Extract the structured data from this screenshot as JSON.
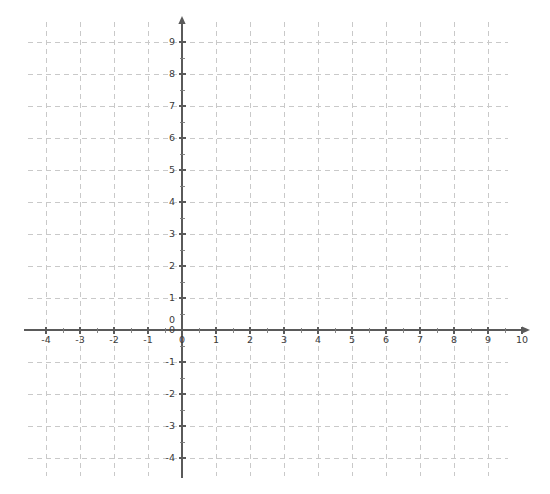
{
  "chart_data": {
    "type": "scatter",
    "title": "",
    "subtitle": "",
    "xlabel": "",
    "ylabel": "",
    "grid": true,
    "grid_style": "dashed",
    "legend": "none",
    "series": [],
    "x": [],
    "values": [],
    "xlim": [
      -4.55,
      10.85
    ],
    "ylim": [
      -4.55,
      9.7
    ],
    "x_axis": {
      "min": -4,
      "max": 10,
      "major_step": 1,
      "minor_step": 0.5,
      "arrow": "right",
      "tick_labels": [
        "-4",
        "-3",
        "-2",
        "-1",
        "0",
        "1",
        "2",
        "3",
        "4",
        "5",
        "6",
        "7",
        "8",
        "9",
        "10"
      ],
      "tick_values": [
        -4,
        -3,
        -2,
        -1,
        0,
        1,
        2,
        3,
        4,
        5,
        6,
        7,
        8,
        9,
        10
      ]
    },
    "y_axis": {
      "min": -4,
      "max": 9,
      "major_step": 1,
      "minor_step": 0.5,
      "arrow": "up",
      "tick_labels": [
        "-4",
        "-3",
        "-2",
        "-1",
        "0",
        "1",
        "2",
        "3",
        "4",
        "5",
        "6",
        "7",
        "8",
        "9"
      ],
      "tick_values": [
        -4,
        -3,
        -2,
        -1,
        0,
        1,
        2,
        3,
        4,
        5,
        6,
        7,
        8,
        9
      ]
    },
    "origin_label": "0"
  },
  "colors": {
    "background": "#ffffff",
    "gridline": "#c9c9c9",
    "axis": "#5a5a5a",
    "tick_text": "#3a3a3a"
  },
  "geometry": {
    "width": 550,
    "height": 494,
    "origin_x": 182,
    "origin_y": 330,
    "unit_x": 34,
    "unit_y": 32,
    "grid_left": 28,
    "grid_right": 508,
    "grid_top": 22,
    "grid_bottom": 476,
    "x_arrow_tip": 530,
    "y_arrow_tip": 16
  }
}
